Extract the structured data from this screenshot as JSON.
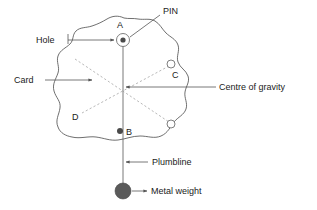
{
  "diagram": {
    "type": "physics-apparatus-diagram",
    "background_color": "#ffffff",
    "line_color": "#555555",
    "dashed_color": "#9a9a9a",
    "weight_color": "#5a5a5a",
    "callouts": [
      {
        "id": "pin",
        "label": "PIN"
      },
      {
        "id": "hole",
        "label": "Hole"
      },
      {
        "id": "card",
        "label": "Card"
      },
      {
        "id": "cog",
        "label": "Centre of gravity"
      },
      {
        "id": "plumb",
        "label": "Plumbline"
      },
      {
        "id": "weight",
        "label": "Metal weight"
      }
    ],
    "points": [
      {
        "id": "a",
        "label": "A"
      },
      {
        "id": "b",
        "label": "B"
      },
      {
        "id": "c",
        "label": "C"
      },
      {
        "id": "d",
        "label": "D"
      }
    ]
  }
}
